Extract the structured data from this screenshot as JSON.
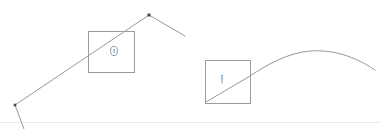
{
  "figure": {
    "width": 381,
    "height": 129,
    "background_color": "#ffffff"
  },
  "colors": {
    "stroke": "#8a8a92",
    "stroke_dark": "#6f6f77",
    "marker": "#4a4a52",
    "box_border": "#9a9aa2",
    "baseline": "#e6e6ea"
  },
  "stroke_widths": {
    "path": 0.9,
    "box": 1.0,
    "baseline": 0.8
  },
  "baseline": {
    "label": "bottom-baseline",
    "x1": 0,
    "y1": 122.5,
    "x2": 381,
    "y2": 122.5
  },
  "left_figure": {
    "label": "peaked-polyline-figure",
    "polyline_points": "24,129 15,105 149,15 185,36",
    "segments": [
      {
        "name": "tail-segment",
        "from": [
          24,
          129
        ],
        "to": [
          15,
          105
        ]
      },
      {
        "name": "rising-segment",
        "from": [
          15,
          105
        ],
        "to": [
          149,
          15
        ]
      },
      {
        "name": "falling-segment",
        "from": [
          149,
          15
        ],
        "to": [
          185,
          36
        ]
      }
    ],
    "vertices": [
      {
        "name": "lower-left-vertex",
        "x": 15,
        "y": 105,
        "size": 2.6
      },
      {
        "name": "apex-vertex",
        "x": 149,
        "y": 15,
        "size": 3.0
      }
    ],
    "box": {
      "name": "left-inspection-box",
      "x": 88,
      "y": 31,
      "width": 46,
      "height": 41
    },
    "glyph": {
      "name": "circled-marker-glyph",
      "cx": 114,
      "cy": 51,
      "rx": 3.4,
      "ry": 4.6,
      "text": "I"
    }
  },
  "right_figure": {
    "label": "curve-figure",
    "path": "M 206,102 L 250,76 C 268,64 288,53 310,51 C 338,49 360,60 375,70",
    "straight_part": {
      "from": [
        206,
        102
      ],
      "to": [
        250,
        76
      ]
    },
    "curve_peak": {
      "x": 310,
      "y": 51
    },
    "curve_end": {
      "x": 375,
      "y": 70
    },
    "box": {
      "name": "right-inspection-box",
      "x": 205,
      "y": 60,
      "width": 45,
      "height": 43
    },
    "glyph": {
      "name": "tick-marker-glyph",
      "x": 222,
      "y": 78,
      "text": "I"
    }
  }
}
